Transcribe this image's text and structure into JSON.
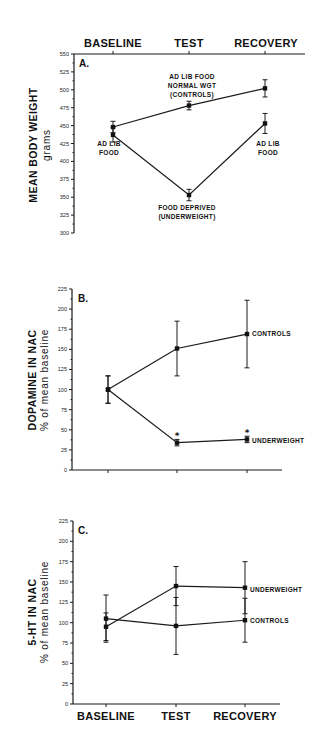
{
  "chart_data": [
    {
      "panel": "A.",
      "type": "line",
      "title": "",
      "xlabel": "",
      "ylabel": "MEAN BODY WEIGHT",
      "ylabel_sub": "grams",
      "categories": [
        "BASELINE",
        "TEST",
        "RECOVERY"
      ],
      "category_axis_position": "top",
      "ylim": [
        300,
        550
      ],
      "yticks": [
        300,
        325,
        350,
        375,
        400,
        425,
        450,
        475,
        500,
        525,
        550
      ],
      "series": [
        {
          "name": "AD LIB FOOD NORMAL WGT (CONTROLS)",
          "values": [
            448,
            478,
            502
          ],
          "errors": [
            8,
            6,
            12
          ]
        },
        {
          "name": "FOOD DEPRIVED (UNDERWEIGHT)",
          "values": [
            437,
            353,
            453
          ],
          "errors": [
            10,
            8,
            14
          ]
        }
      ],
      "annotations": [
        {
          "text_lines": [
            "AD LIB FOOD",
            "NORMAL WGT",
            "(CONTROLS)"
          ],
          "near": "TEST, controls"
        },
        {
          "text_lines": [
            "AD LIB",
            "FOOD"
          ],
          "near": "BASELINE"
        },
        {
          "text_lines": [
            "AD LIB",
            "FOOD"
          ],
          "near": "RECOVERY, underweight"
        },
        {
          "text_lines": [
            "FOOD DEPRIVED",
            "(UNDERWEIGHT)"
          ],
          "near": "TEST, underweight"
        }
      ]
    },
    {
      "panel": "B.",
      "type": "line",
      "title": "",
      "xlabel": "",
      "ylabel": "DOPAMINE IN NAC",
      "ylabel_sub": "% of mean baseline",
      "categories": [
        "BASELINE",
        "TEST",
        "RECOVERY"
      ],
      "ylim": [
        0,
        225
      ],
      "yticks": [
        0,
        25,
        50,
        75,
        100,
        125,
        150,
        175,
        200,
        225
      ],
      "series": [
        {
          "name": "CONTROLS",
          "values": [
            100,
            151,
            169
          ],
          "errors": [
            17,
            34,
            42
          ]
        },
        {
          "name": "UNDERWEIGHT",
          "values": [
            100,
            34,
            38
          ],
          "errors": [
            17,
            4,
            4
          ]
        }
      ],
      "significance_markers": [
        {
          "category": "TEST",
          "series": "UNDERWEIGHT",
          "marker": "*"
        },
        {
          "category": "RECOVERY",
          "series": "UNDERWEIGHT",
          "marker": "*"
        }
      ]
    },
    {
      "panel": "C.",
      "type": "line",
      "title": "",
      "xlabel": "",
      "ylabel": "5-HT IN NAC",
      "ylabel_sub": "% of mean baseline",
      "categories": [
        "BASELINE",
        "TEST",
        "RECOVERY"
      ],
      "ylim": [
        0,
        225
      ],
      "yticks": [
        0,
        25,
        50,
        75,
        100,
        125,
        150,
        175,
        200,
        225
      ],
      "series": [
        {
          "name": "UNDERWEIGHT",
          "values": [
            95,
            145,
            143
          ],
          "errors": [
            17,
            24,
            32
          ]
        },
        {
          "name": "CONTROLS",
          "values": [
            105,
            96,
            103
          ],
          "errors": [
            29,
            35,
            27
          ]
        }
      ]
    }
  ],
  "labels": {
    "panelA": {
      "tag": "A.",
      "y1": "MEAN BODY WEIGHT",
      "y2": "grams",
      "cats": [
        "BASELINE",
        "TEST",
        "RECOVERY"
      ],
      "ctrl1": "AD LIB FOOD",
      "ctrl2": "NORMAL WGT",
      "ctrl3": "(CONTROLS)",
      "adlib1": "AD LIB",
      "adlib2": "FOOD",
      "dep1": "FOOD DEPRIVED",
      "dep2": "(UNDERWEIGHT)"
    },
    "panelB": {
      "tag": "B.",
      "y1": "DOPAMINE IN NAC",
      "y2": "% of mean baseline",
      "controls": "CONTROLS",
      "underweight": "UNDERWEIGHT",
      "star": "*"
    },
    "panelC": {
      "tag": "C.",
      "y1": "5-HT IN NAC",
      "y2": "% of mean baseline",
      "controls": "CONTROLS",
      "underweight": "UNDERWEIGHT",
      "cats": [
        "BASELINE",
        "TEST",
        "RECOVERY"
      ]
    }
  }
}
